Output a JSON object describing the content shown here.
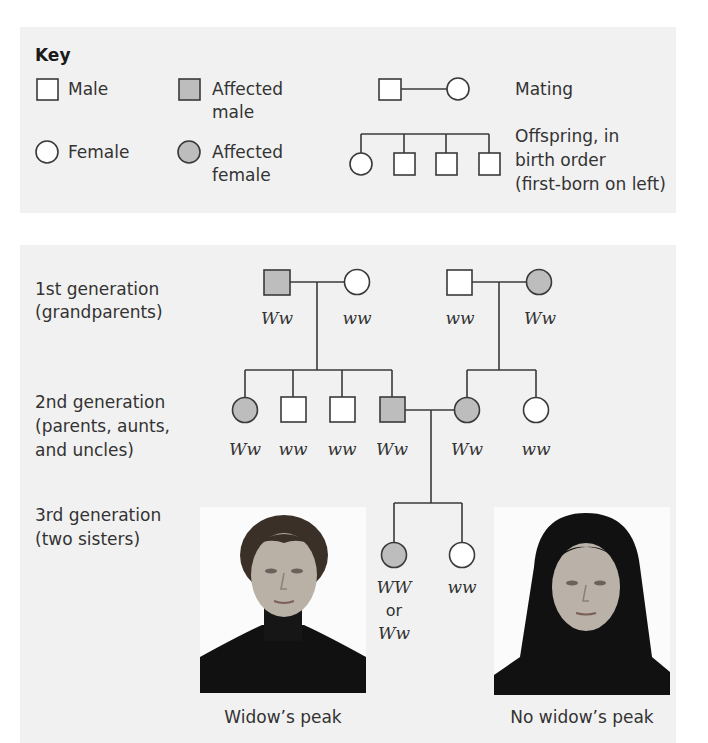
{
  "key": {
    "title": "Key",
    "male": "Male",
    "affected_male_1": "Affected",
    "affected_male_2": "male",
    "female": "Female",
    "affected_female_1": "Affected",
    "affected_female_2": "female",
    "mating": "Mating",
    "offspring_1": "Offspring, in",
    "offspring_2": "birth order",
    "offspring_3": "(first-born on left)"
  },
  "colors": {
    "affected_fill": "#bdbdbd",
    "unaffected_fill": "#ffffff",
    "line": "#3a3a3a",
    "panel_bg": "#f1f1f1"
  },
  "generations": {
    "gen1_line1": "1st generation",
    "gen1_line2": "(grandparents)",
    "gen2_line1": "2nd generation",
    "gen2_line2": "(parents, aunts,",
    "gen2_line3": "and uncles)",
    "gen3_line1": "3rd generation",
    "gen3_line2": "(two sisters)"
  },
  "pedigree": {
    "gen1": [
      {
        "sex": "male",
        "affected": true,
        "genotype": "Ww"
      },
      {
        "sex": "female",
        "affected": false,
        "genotype": "ww"
      },
      {
        "sex": "male",
        "affected": false,
        "genotype": "ww"
      },
      {
        "sex": "female",
        "affected": true,
        "genotype": "Ww"
      }
    ],
    "gen2": [
      {
        "sex": "female",
        "affected": true,
        "genotype": "Ww"
      },
      {
        "sex": "male",
        "affected": false,
        "genotype": "ww"
      },
      {
        "sex": "male",
        "affected": false,
        "genotype": "ww"
      },
      {
        "sex": "male",
        "affected": true,
        "genotype": "Ww"
      },
      {
        "sex": "female",
        "affected": true,
        "genotype": "Ww"
      },
      {
        "sex": "female",
        "affected": false,
        "genotype": "ww"
      }
    ],
    "gen3": [
      {
        "sex": "female",
        "affected": true,
        "genotype": "WW",
        "or": "or",
        "genotype_alt": "Ww"
      },
      {
        "sex": "female",
        "affected": false,
        "genotype": "ww"
      }
    ]
  },
  "photos": {
    "left_caption": "Widow’s peak",
    "right_caption": "No widow’s peak"
  }
}
